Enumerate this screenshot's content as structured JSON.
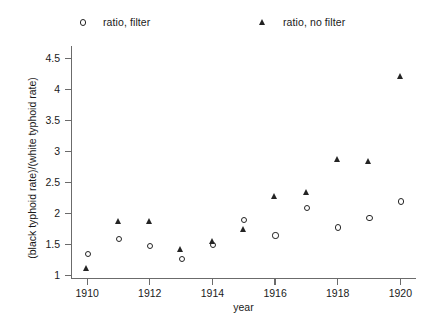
{
  "chart_data": {
    "type": "scatter",
    "title": "",
    "xlabel": "year",
    "ylabel": "(black typhoid rate)/(white typhoid rate)",
    "x": [
      1910,
      1911,
      1912,
      1913,
      1914,
      1915,
      1916,
      1917,
      1918,
      1919,
      1920
    ],
    "xlim": [
      1909.5,
      1920.5
    ],
    "ylim": [
      0.95,
      4.7
    ],
    "xticks": [
      1910,
      1912,
      1914,
      1916,
      1918,
      1920
    ],
    "xticklabels": [
      "1910",
      "1912",
      "1914",
      "1916",
      "1918",
      "1920"
    ],
    "yticks": [
      1,
      1.5,
      2,
      2.5,
      3,
      3.5,
      4,
      4.5
    ],
    "yticklabels": [
      "1",
      "1.5",
      "2",
      "2.5",
      "3",
      "3.5",
      "4",
      "4.5"
    ],
    "grid": false,
    "legend_position": "above-axes",
    "series": [
      {
        "name": "ratio, filter",
        "marker": "circle-open",
        "color": "#242424",
        "values": [
          1.35,
          1.6,
          1.48,
          1.27,
          1.5,
          1.9,
          1.65,
          2.1,
          1.78,
          1.93,
          2.2
        ]
      },
      {
        "name": "ratio, no filter",
        "marker": "triangle-open",
        "color": "#242424",
        "values": [
          1.12,
          1.88,
          1.88,
          1.43,
          1.55,
          1.75,
          2.28,
          2.35,
          2.87,
          2.85,
          4.22
        ]
      }
    ]
  },
  "legend": {
    "entries": [
      {
        "label": "ratio, filter",
        "marker": "circle"
      },
      {
        "label": "ratio, no filter",
        "marker": "triangle"
      }
    ]
  },
  "axes": {
    "xlabel": "year",
    "ylabel": "(black typhoid rate)/(white typhoid rate)"
  }
}
